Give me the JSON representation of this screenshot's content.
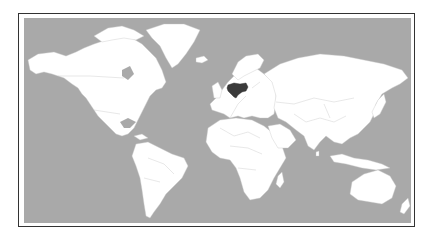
{
  "map": {
    "type": "world-locator-map",
    "projection": "equirectangular-like",
    "highlighted_country": "Ukraine",
    "colors": {
      "ocean": "#a9a9a9",
      "land": "#ffffff",
      "highlight": "#3a3a3a",
      "borders": "#c0c0c0",
      "frame": "#333333"
    },
    "regions": [
      {
        "name": "North America"
      },
      {
        "name": "Greenland"
      },
      {
        "name": "South America"
      },
      {
        "name": "Europe"
      },
      {
        "name": "Africa"
      },
      {
        "name": "Asia"
      },
      {
        "name": "Australia"
      },
      {
        "name": "New Zealand"
      },
      {
        "name": "Ukraine",
        "highlighted": true
      }
    ]
  }
}
